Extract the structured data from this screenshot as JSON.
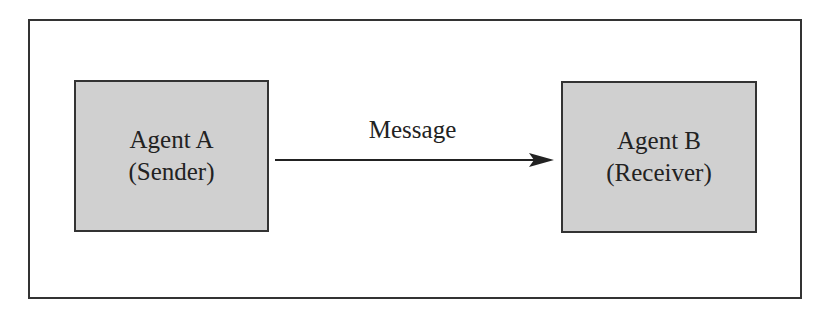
{
  "diagram": {
    "nodes": [
      {
        "id": "agent-a",
        "title": "Agent A",
        "role": "(Sender)"
      },
      {
        "id": "agent-b",
        "title": "Agent B",
        "role": "(Receiver)"
      }
    ],
    "edges": [
      {
        "from": "agent-a",
        "to": "agent-b",
        "label": "Message"
      }
    ],
    "colors": {
      "node_fill": "#d0d0d0",
      "stroke": "#333333"
    }
  }
}
